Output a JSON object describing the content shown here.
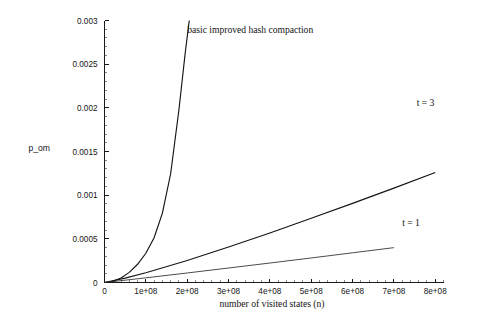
{
  "chart_data": {
    "type": "line",
    "title": "",
    "xlabel": "number of visited states (n)",
    "ylabel": "p_om",
    "xlim": [
      0,
      820000000
    ],
    "ylim": [
      0,
      0.003
    ],
    "grid": false,
    "legend_position": "inline-annotations",
    "x_ticks": [
      {
        "value": 0,
        "label": "0"
      },
      {
        "value": 100000000,
        "label": "1e+08"
      },
      {
        "value": 200000000,
        "label": "2e+08"
      },
      {
        "value": 300000000,
        "label": "3e+08"
      },
      {
        "value": 400000000,
        "label": "4e+08"
      },
      {
        "value": 500000000,
        "label": "5e+08"
      },
      {
        "value": 600000000,
        "label": "6e+08"
      },
      {
        "value": 700000000,
        "label": "7e+08"
      },
      {
        "value": 800000000,
        "label": "8e+08"
      }
    ],
    "y_ticks": [
      {
        "value": 0,
        "label": "0"
      },
      {
        "value": 0.0005,
        "label": "0.0005"
      },
      {
        "value": 0.001,
        "label": "0.001"
      },
      {
        "value": 0.0015,
        "label": "0.0015"
      },
      {
        "value": 0.002,
        "label": "0.002"
      },
      {
        "value": 0.0025,
        "label": "0.0025"
      },
      {
        "value": 0.003,
        "label": "0.003"
      }
    ],
    "series": [
      {
        "name": "basic improved hash compaction",
        "annotation": "basic improved hash compaction",
        "annotation_x": 200000000,
        "annotation_y": 0.00286,
        "x": [
          0,
          20000000,
          40000000,
          60000000,
          80000000,
          100000000,
          120000000,
          140000000,
          160000000,
          180000000,
          195000000,
          205000000
        ],
        "y": [
          0.0,
          1.35e-05,
          5.2e-05,
          0.000116,
          0.000209,
          0.000335,
          0.000512,
          0.000795,
          0.001245,
          0.001975,
          0.00262,
          0.003
        ]
      },
      {
        "name": "t = 3",
        "annotation": "t = 3",
        "annotation_x": 755000000,
        "annotation_y": 0.00202,
        "x": [
          0,
          50000000,
          100000000,
          200000000,
          300000000,
          400000000,
          500000000,
          600000000,
          700000000,
          800000000
        ],
        "y": [
          0.0,
          5e-05,
          0.000112,
          0.000252,
          0.000406,
          0.000567,
          0.000735,
          0.000906,
          0.001081,
          0.00126
        ]
      },
      {
        "name": "t = 1",
        "annotation": "t = 1",
        "annotation_x": 720000000,
        "annotation_y": 0.000648,
        "x": [
          0,
          100000000,
          200000000,
          300000000,
          400000000,
          500000000,
          600000000,
          700000000
        ],
        "y": [
          0.0,
          5.35e-05,
          0.000109,
          0.000166,
          0.000223,
          0.000281,
          0.00034,
          0.000399
        ]
      }
    ]
  },
  "figure": {
    "background": "#ffffff",
    "line_color": "#141414",
    "axis_color": "#1a1a1a"
  }
}
